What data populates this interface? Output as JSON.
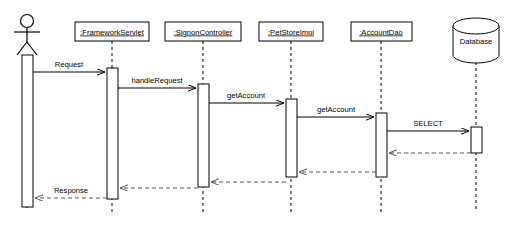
{
  "diagram": {
    "type": "uml-sequence-diagram",
    "width": 505,
    "height": 235,
    "background_color": "#ffffff",
    "line_color": "#000000",
    "return_line_color": "#555555"
  },
  "participants": [
    {
      "id": "actor",
      "kind": "actor",
      "label": "",
      "lifeline_x": 27,
      "box": null,
      "activation": {
        "x": 22,
        "y": 55,
        "w": 11,
        "h": 152
      }
    },
    {
      "id": "frameworkservlet",
      "kind": "object",
      "label": ":FrameworkServlet",
      "lifeline_x": 112,
      "box": {
        "x": 75,
        "y": 22,
        "w": 74,
        "h": 19
      },
      "activation": {
        "x": 107,
        "y": 68,
        "w": 11,
        "h": 131
      }
    },
    {
      "id": "signoncontroller",
      "kind": "object",
      "label": ":SignonController",
      "lifeline_x": 203,
      "box": {
        "x": 165,
        "y": 22,
        "w": 76,
        "h": 19
      },
      "activation": {
        "x": 198,
        "y": 84,
        "w": 11,
        "h": 103
      }
    },
    {
      "id": "petstoreimpl",
      "kind": "object",
      "label": ":PetStoreImpl",
      "lifeline_x": 291,
      "box": {
        "x": 259,
        "y": 22,
        "w": 64,
        "h": 19
      },
      "activation": {
        "x": 286,
        "y": 99,
        "w": 11,
        "h": 78
      }
    },
    {
      "id": "accountdao",
      "kind": "object",
      "label": ":AccountDao",
      "lifeline_x": 381,
      "box": {
        "x": 351,
        "y": 22,
        "w": 61,
        "h": 19
      },
      "activation": {
        "x": 376,
        "y": 113,
        "w": 11,
        "h": 64
      }
    },
    {
      "id": "database",
      "kind": "database",
      "label": "Database",
      "lifeline_x": 476,
      "box": null,
      "activation": {
        "x": 471,
        "y": 127,
        "w": 11,
        "h": 26
      }
    }
  ],
  "messages": [
    {
      "id": "m1",
      "label": "Request",
      "from": "actor",
      "to": "frameworkservlet",
      "y": 72,
      "kind": "call"
    },
    {
      "id": "m2",
      "label": "handleRequest",
      "from": "frameworkservlet",
      "to": "signoncontroller",
      "y": 88,
      "kind": "call"
    },
    {
      "id": "m3",
      "label": "getAccount",
      "from": "signoncontroller",
      "to": "petstoreimpl",
      "y": 103,
      "kind": "call"
    },
    {
      "id": "m4",
      "label": "getAccount",
      "from": "petstoreimpl",
      "to": "accountdao",
      "y": 117,
      "kind": "call"
    },
    {
      "id": "m5",
      "label": "SELECT",
      "from": "accountdao",
      "to": "database",
      "y": 131,
      "kind": "call"
    },
    {
      "id": "r1",
      "label": "",
      "from": "database",
      "to": "accountdao",
      "y": 153,
      "kind": "return"
    },
    {
      "id": "r2",
      "label": "",
      "from": "accountdao",
      "to": "petstoreimpl",
      "y": 172,
      "kind": "return"
    },
    {
      "id": "r3",
      "label": "",
      "from": "petstoreimpl",
      "to": "signoncontroller",
      "y": 182,
      "kind": "return"
    },
    {
      "id": "r4",
      "label": "",
      "from": "signoncontroller",
      "to": "frameworkservlet",
      "y": 188,
      "kind": "return"
    },
    {
      "id": "r5",
      "label": "Response",
      "from": "frameworkservlet",
      "to": "actor",
      "y": 198,
      "kind": "return"
    }
  ]
}
